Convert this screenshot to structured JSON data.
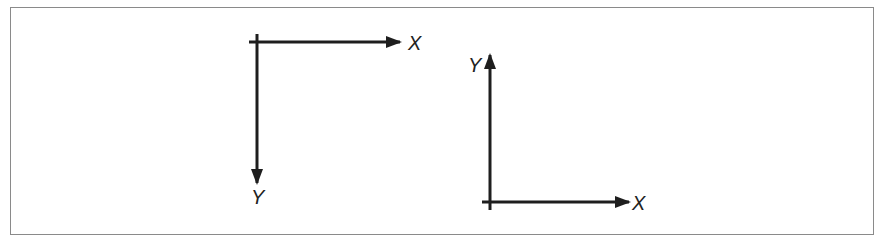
{
  "figure": {
    "colors": {
      "stroke": "#1e1e1e",
      "frame": "#8a8a8a",
      "background": "#ffffff"
    },
    "left_system": {
      "name": "screen coordinates (Y down)",
      "x_label": "X",
      "y_label": "Y",
      "x_direction": "right",
      "y_direction": "down"
    },
    "right_system": {
      "name": "cartesian coordinates (Y up)",
      "x_label": "X",
      "y_label": "Y",
      "x_direction": "right",
      "y_direction": "up"
    }
  }
}
